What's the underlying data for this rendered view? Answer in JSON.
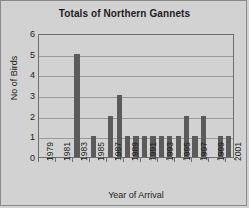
{
  "chart_data": {
    "type": "bar",
    "title": "Totals of Northern Gannets",
    "xlabel": "Year of Arrival",
    "ylabel": "No of Birds",
    "ylim": [
      0,
      6
    ],
    "ytick_labels": [
      "0",
      "1",
      "2",
      "3",
      "4",
      "5",
      "6"
    ],
    "grid": true,
    "legend": null,
    "categories": [
      "1979",
      "1980",
      "1981",
      "1982",
      "1983",
      "1984",
      "1985",
      "1986",
      "1987",
      "1988",
      "1989",
      "1990",
      "1991",
      "1992",
      "1993",
      "1994",
      "1995",
      "1996",
      "1997",
      "1998",
      "1999",
      "2000",
      "2001"
    ],
    "visible_tick_labels": [
      "1979",
      "1981",
      "1983",
      "1985",
      "1987",
      "1989",
      "1991",
      "1993",
      "1995",
      "1997",
      "1999",
      "2001"
    ],
    "values": [
      0,
      0,
      0,
      0,
      5,
      0,
      1,
      0,
      2,
      3,
      1,
      1,
      1,
      1,
      1,
      1,
      1,
      2,
      1,
      2,
      0,
      1,
      1
    ],
    "bar_color": "#5b5b5b",
    "plot_background": "#d2d2d2",
    "gridline_color": "#9a9a9a",
    "axis_color": "#6e6e6e"
  }
}
